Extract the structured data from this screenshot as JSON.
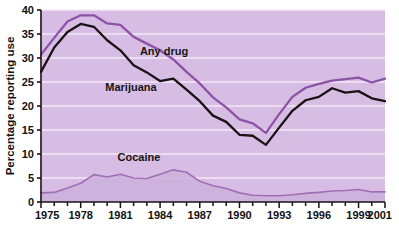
{
  "chart_data": {
    "type": "line",
    "title": "",
    "subtitle": "",
    "xlabel": "",
    "ylabel": "Percentage reporting use",
    "xlim": [
      1975,
      2001
    ],
    "ylim": [
      0,
      40
    ],
    "grid": true,
    "legend_position": "inline-annotations",
    "x": [
      1975,
      1976,
      1977,
      1978,
      1979,
      1980,
      1981,
      1982,
      1983,
      1984,
      1985,
      1986,
      1987,
      1988,
      1989,
      1990,
      1991,
      1992,
      1993,
      1994,
      1995,
      1996,
      1997,
      1998,
      1999,
      2000,
      2001
    ],
    "x_tick_labels": [
      "1975",
      "1978",
      "1981",
      "1984",
      "1987",
      "1990",
      "1993",
      "1996",
      "1999",
      "2001"
    ],
    "x_tick_values": [
      1975,
      1978,
      1981,
      1984,
      1987,
      1990,
      1993,
      1996,
      1999,
      2001
    ],
    "y_tick_labels": [
      "0",
      "5",
      "10",
      "15",
      "20",
      "25",
      "30",
      "35",
      "40"
    ],
    "y_tick_values": [
      0,
      5,
      10,
      15,
      20,
      25,
      30,
      35,
      40
    ],
    "series": [
      {
        "name": "Any drug",
        "color": "#8c52a8",
        "label_text": "Any drug",
        "label_x": 1984.3,
        "label_y": 30.6,
        "values": [
          30.7,
          34.2,
          37.6,
          38.9,
          38.9,
          37.2,
          36.9,
          34.4,
          33.0,
          31.6,
          29.7,
          27.1,
          24.7,
          21.8,
          19.7,
          17.2,
          16.4,
          14.4,
          18.3,
          21.9,
          23.8,
          24.6,
          25.3,
          25.6,
          25.9,
          24.9,
          25.7
        ],
        "linewidth": 2.3
      },
      {
        "name": "Marijuana",
        "color": "#1a1114",
        "label_text": "Marijuana",
        "label_x": 1981.8,
        "label_y": 23.2,
        "values": [
          27.1,
          32.2,
          35.4,
          37.1,
          36.5,
          33.7,
          31.6,
          28.5,
          27.0,
          25.2,
          25.7,
          23.4,
          21.0,
          18.0,
          16.7,
          14.0,
          13.8,
          11.9,
          15.5,
          19.0,
          21.2,
          21.9,
          23.7,
          22.8,
          23.1,
          21.6,
          21.0
        ],
        "linewidth": 2.3
      },
      {
        "name": "Cocaine",
        "color": "#9f6fb5",
        "label_text": "Cocaine",
        "label_x": 1982.4,
        "label_y": 8.6,
        "values": [
          1.9,
          2.0,
          2.9,
          3.9,
          5.7,
          5.2,
          5.8,
          5.0,
          4.9,
          5.8,
          6.7,
          6.2,
          4.3,
          3.4,
          2.8,
          1.9,
          1.4,
          1.3,
          1.3,
          1.5,
          1.8,
          2.0,
          2.3,
          2.4,
          2.6,
          2.1,
          2.1
        ],
        "linewidth": 1.6,
        "filled": true
      }
    ]
  },
  "axis": {
    "y_axis_title": "Percentage reporting use"
  },
  "style": {
    "plot_background": "#d7bde4",
    "gridline_color": "#f3e8f7",
    "axis_color": "#1a1114",
    "page_background": "#ffffff"
  }
}
